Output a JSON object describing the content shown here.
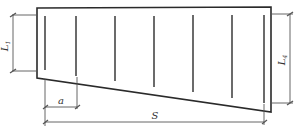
{
  "diagram": {
    "type": "engineering-schematic",
    "colors": {
      "outline": "#2a2a2a",
      "bars": "#3a3a3a",
      "dims": "#555555",
      "background": "#ffffff"
    },
    "labels": {
      "left_height": "L",
      "left_height_sub": "1",
      "right_height": "L",
      "right_height_sub": "4",
      "spacing": "a",
      "span": "S"
    },
    "bars": [
      {
        "x": 45,
        "top": 16,
        "bottom": 70
      },
      {
        "x": 76,
        "top": 16,
        "bottom": 76
      },
      {
        "x": 115,
        "top": 16,
        "bottom": 81
      },
      {
        "x": 154,
        "top": 16,
        "bottom": 87
      },
      {
        "x": 193,
        "top": 15,
        "bottom": 92
      },
      {
        "x": 232,
        "top": 15,
        "bottom": 98
      },
      {
        "x": 264,
        "top": 15,
        "bottom": 103
      }
    ]
  }
}
